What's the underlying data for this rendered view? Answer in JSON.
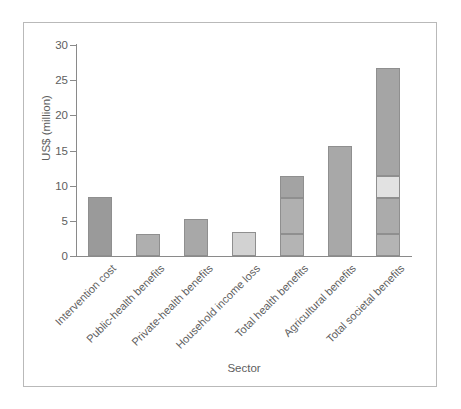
{
  "chart_data": {
    "type": "bar",
    "title": "",
    "xlabel": "Sector",
    "ylabel": "US$ (million)",
    "ylim": [
      0,
      30
    ],
    "yticks": [
      0,
      5,
      10,
      15,
      20,
      25,
      30
    ],
    "ytick_labels": [
      "0",
      "5",
      "10",
      "15",
      "20",
      "25",
      "30"
    ],
    "grid": false,
    "legend": "none",
    "stacked": true,
    "categories": [
      "Intervention cost",
      "Public-health benefits",
      "Private-health benefits",
      "Household income loss",
      "Total health benefits",
      "Agricultural benefits",
      "Total societal benefits"
    ],
    "values": [
      8.4,
      3.1,
      5.2,
      3.4,
      11.4,
      15.6,
      26.8
    ],
    "bars": [
      {
        "category": "Intervention cost",
        "total": 8.4,
        "segments": [
          {
            "label": "Intervention cost",
            "value": 8.4,
            "color": "#9a9a9a"
          }
        ]
      },
      {
        "category": "Public-health benefits",
        "total": 3.1,
        "segments": [
          {
            "label": "Public-health benefits",
            "value": 3.1,
            "color": "#afafaf"
          }
        ]
      },
      {
        "category": "Private-health benefits",
        "total": 5.2,
        "segments": [
          {
            "label": "Private-health benefits",
            "value": 5.2,
            "color": "#a8a8a8"
          }
        ]
      },
      {
        "category": "Household income loss",
        "total": 3.4,
        "segments": [
          {
            "label": "Household income loss",
            "value": 3.4,
            "color": "#d2d2d2"
          }
        ]
      },
      {
        "category": "Total health benefits",
        "total": 11.4,
        "segments": [
          {
            "label": "Public-health benefits",
            "value": 3.1,
            "color": "#b4b4b4"
          },
          {
            "label": "Private-health benefits",
            "value": 5.2,
            "color": "#b0b0b0"
          },
          {
            "label": "Household income loss",
            "value": 3.1,
            "color": "#a3a3a3"
          }
        ]
      },
      {
        "category": "Agricultural benefits",
        "total": 15.6,
        "segments": [
          {
            "label": "Agricultural benefits",
            "value": 15.6,
            "color": "#a8a8a8"
          }
        ]
      },
      {
        "category": "Total societal benefits",
        "total": 26.8,
        "segments": [
          {
            "label": "Public-health benefits",
            "value": 3.1,
            "color": "#b4b4b4"
          },
          {
            "label": "Private-health benefits",
            "value": 5.2,
            "color": "#ababab"
          },
          {
            "label": "Household income loss",
            "value": 3.1,
            "color": "#e2e2e2"
          },
          {
            "label": "Agricultural benefits",
            "value": 15.4,
            "color": "#a5a5a5"
          }
        ]
      }
    ],
    "colors": {
      "axis": "#8a8a8a",
      "text": "#5e5e5e",
      "bar_outline": "#8f8f8f",
      "frame": "#b9b9b9",
      "background": "#ffffff"
    }
  }
}
